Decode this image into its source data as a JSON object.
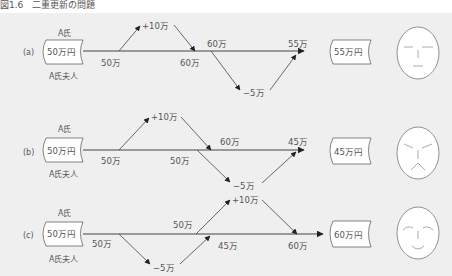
{
  "caption": "図1.6　二重更新の問題",
  "colors": {
    "background": "#efefef",
    "line": "#444444",
    "text": "#555555",
    "box_fill": "#ffffff"
  },
  "rows": [
    {
      "id": "a",
      "label": "(a)",
      "owner_top": "A氏",
      "owner_bottom": "A氏夫人",
      "start_box": "50万円",
      "upper_start": "50万",
      "upper_delta": "+10万",
      "upper_result": "60万",
      "lower_start": "60万",
      "lower_delta": "−5万",
      "lower_result": "55万",
      "end_box": "55万円",
      "face": "neutral"
    },
    {
      "id": "b",
      "label": "(b)",
      "owner_top": "A氏",
      "owner_bottom": "A氏夫人",
      "start_box": "50万円",
      "upper_start": "50万",
      "upper_delta": "+10万",
      "upper_result": "60万",
      "lower_start": "50万",
      "lower_delta": "−5万",
      "lower_result": "45万",
      "end_box": "45万円",
      "face": "angry"
    },
    {
      "id": "c",
      "label": "(c)",
      "owner_top": "A氏",
      "owner_bottom": "A氏夫人",
      "start_box": "50万円",
      "upper_start": "50万",
      "upper_delta": "+10万",
      "upper_result": "60万",
      "lower_start": "50万",
      "lower_delta": "−5万",
      "lower_result": "45万",
      "end_box": "60万円",
      "face": "happy"
    }
  ]
}
